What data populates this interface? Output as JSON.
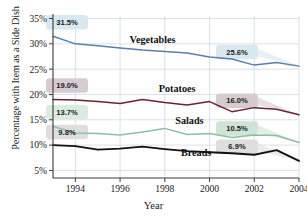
{
  "chart_data": {
    "type": "line",
    "title": "",
    "xlabel": "Year",
    "ylabel": "Percentage with Item as a Side Dish",
    "x": [
      1993,
      1994,
      1995,
      1996,
      1997,
      1998,
      1999,
      2000,
      2001,
      2002,
      2003,
      2004
    ],
    "xlim": [
      1993,
      2004
    ],
    "ylim": [
      3.5,
      35.5
    ],
    "xticks": [
      1994,
      1996,
      1998,
      2000,
      2002,
      2004
    ],
    "xticklabels": [
      "1994",
      "1996",
      "1998",
      "2000",
      "2002",
      "2004"
    ],
    "yticks": [
      5,
      10,
      15,
      20,
      25,
      30,
      35
    ],
    "yticklabels": [
      "5%",
      "10%",
      "15%",
      "20%",
      "25%",
      "30%",
      "35%"
    ],
    "grid": true,
    "legend": "inline-labels",
    "series": [
      {
        "name": "Vegetables",
        "color": "#5b7fa8",
        "values": [
          31.5,
          30.0,
          29.6,
          29.2,
          28.8,
          28.5,
          28.2,
          27.4,
          27.0,
          25.8,
          26.3,
          25.6
        ]
      },
      {
        "name": "Potatoes",
        "color": "#6b2232",
        "values": [
          19.0,
          18.9,
          18.6,
          18.2,
          19.0,
          18.4,
          17.9,
          18.6,
          16.6,
          17.4,
          17.1,
          16.0
        ]
      },
      {
        "name": "Salads",
        "color": "#8fbda2",
        "values": [
          13.7,
          12.4,
          12.3,
          12.0,
          12.6,
          13.3,
          12.1,
          12.3,
          11.5,
          12.0,
          11.9,
          10.5
        ]
      },
      {
        "name": "Breads",
        "color": "#111111",
        "values": [
          10.0,
          9.8,
          9.1,
          9.3,
          9.7,
          9.2,
          8.8,
          8.6,
          8.4,
          8.1,
          9.0,
          6.9
        ]
      }
    ],
    "annotations": [
      {
        "label": "31.5%",
        "value": 31.5,
        "series": "Vegetables",
        "x": 1993,
        "side": "left",
        "fill": "#d8e7f0"
      },
      {
        "label": "25.6%",
        "value": 25.6,
        "series": "Vegetables",
        "x": 2004,
        "side": "right",
        "fill": "#d8e7f0"
      },
      {
        "label": "19.0%",
        "value": 19.0,
        "series": "Potatoes",
        "x": 1993,
        "side": "left",
        "fill": "#d6cbcf"
      },
      {
        "label": "16.0%",
        "value": 16.0,
        "series": "Potatoes",
        "x": 2004,
        "side": "right",
        "fill": "#d6cbcf"
      },
      {
        "label": "13.7%",
        "value": 13.7,
        "series": "Salads",
        "x": 1993,
        "side": "left",
        "fill": "#dcebe0"
      },
      {
        "label": "10.5%",
        "value": 10.5,
        "series": "Salads",
        "x": 2004,
        "side": "right",
        "fill": "#cfe4d6"
      },
      {
        "label": "9.8%",
        "value": 9.8,
        "series": "Breads",
        "x": 1993,
        "side": "left",
        "fill": "#dedede"
      },
      {
        "label": "6.9%",
        "value": 6.9,
        "series": "Breads",
        "x": 2004,
        "side": "right",
        "fill": "#dedede"
      }
    ],
    "series_labels": [
      {
        "text": "Vegetables",
        "x": 1997.45,
        "y": 30.1
      },
      {
        "text": "Potatoes",
        "x": 1998.55,
        "y": 20.4
      },
      {
        "text": "Salads",
        "x": 1999.1,
        "y": 14.2
      },
      {
        "text": "Breads",
        "x": 1999.4,
        "y": 7.9
      }
    ]
  }
}
